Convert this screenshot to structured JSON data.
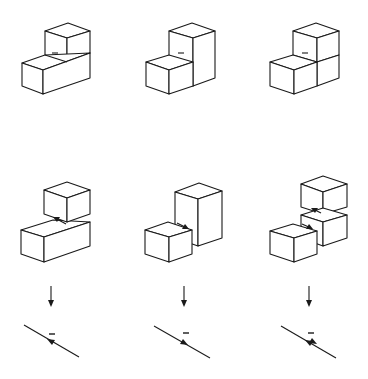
{
  "diagram": {
    "type": "isometric block assemblies with dislocation-style arrows",
    "background": "#ffffff",
    "line_color": "#1a1a1a",
    "rows": [
      {
        "name": "assembled-blocks",
        "panels": [
          {
            "id": "a",
            "description": "small cube on top-back of long lower block, minus mark at joint"
          },
          {
            "id": "b",
            "description": "small cube in front of tall column, minus mark at joint"
          },
          {
            "id": "c",
            "description": "four cubes in L stack, minus mark at joint"
          }
        ]
      },
      {
        "name": "separated-blocks",
        "panels": [
          {
            "id": "a",
            "description": "cube lifted above long block, arrow pointing up-left"
          },
          {
            "id": "b",
            "description": "cube separated from tall column, arrow pointing down-right"
          },
          {
            "id": "c",
            "description": "three cubes separated, two opposing arrows"
          }
        ]
      },
      {
        "name": "down-arrows",
        "count": 3
      },
      {
        "name": "line-symbols",
        "panels": [
          {
            "id": "a",
            "symbol": "diagonal line with arrow pointing up-left and minus sign"
          },
          {
            "id": "b",
            "symbol": "diagonal line with arrow pointing down-right and minus sign"
          },
          {
            "id": "c",
            "symbol": "diagonal line with two opposing arrows and minus sign"
          }
        ]
      }
    ],
    "marks": {
      "minus": "−"
    }
  }
}
